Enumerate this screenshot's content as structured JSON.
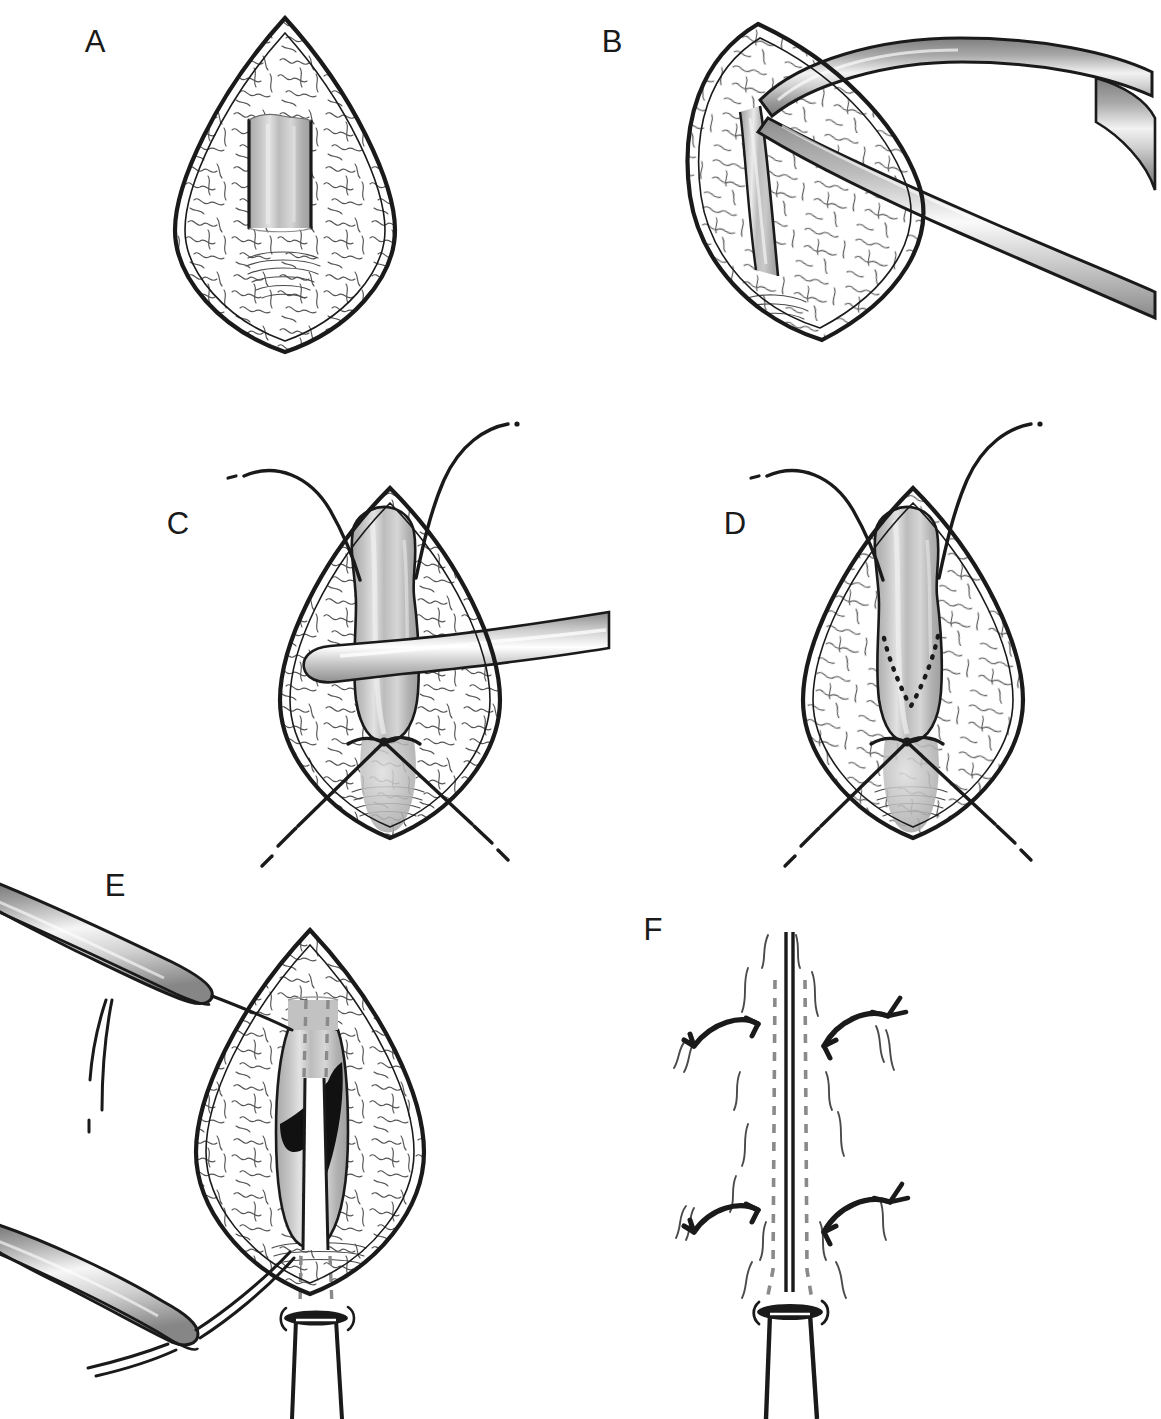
{
  "figure": {
    "type": "medical-surgical-illustration",
    "title": "",
    "caption": "",
    "background_color": "#ffffff",
    "width": 1161,
    "height": 1419,
    "layout": "3 rows x 2 columns of labeled panels",
    "ink_color": "#1a1a1a",
    "tissue_grey": "#b5b5b5",
    "tissue_grey_light": "#d2d2d2",
    "tissue_grey_dark": "#9a9a9a",
    "metal_grey": "#9e9e9e",
    "dashed_grey": "#8c8c8c"
  },
  "panels": [
    {
      "id": "A",
      "label": "A",
      "label_x": 95,
      "label_y": 52,
      "description": "Lens-shaped surgical exposure with wavy textured tissue and a central grey rectangular structure",
      "elements": [
        "lens-shaped-opening",
        "wavy-tissue-texture",
        "central-grey-rectangle"
      ]
    },
    {
      "id": "B",
      "label": "B",
      "label_x": 612,
      "label_y": 52,
      "description": "Lens-shaped exposure with curved surgical forceps grasping the grey tubular structure",
      "elements": [
        "lens-shaped-opening-tilted",
        "curved-forceps",
        "grey-band-structure"
      ]
    },
    {
      "id": "C",
      "label": "C",
      "label_x": 178,
      "label_y": 534,
      "description": "Mobilized grey tubular structure with two stay sutures at top, a probe passing beneath, and crossed sutures at the base",
      "elements": [
        "lens-shaped-opening",
        "grey-tubular-structure",
        "upper-stay-sutures",
        "horizontal-probe",
        "crossed-lower-sutures"
      ]
    },
    {
      "id": "D",
      "label": "D",
      "label_x": 735,
      "label_y": 534,
      "description": "Same exposure with a dotted V-shaped planned incision marked on the grey structure",
      "elements": [
        "lens-shaped-opening",
        "grey-tubular-structure",
        "upper-stay-sutures",
        "dotted-v-incision-marking",
        "crossed-lower-sutures"
      ]
    },
    {
      "id": "E",
      "label": "E",
      "label_x": 115,
      "label_y": 896,
      "description": "Two forceps retract sutures while the opened structure (black flaps) is fitted over a white tube passing through the wound",
      "elements": [
        "lens-shaped-opening",
        "upper-forceps",
        "lower-forceps",
        "black-cut-flaps",
        "white-tube",
        "dashed-tube-path",
        "tube-flange"
      ]
    },
    {
      "id": "F",
      "label": "F",
      "label_x": 653,
      "label_y": 940,
      "description": "Closed midline repair with dashed tube outline and four curved approximation arrows",
      "elements": [
        "midline-closure-line",
        "dashed-tube-outline",
        "curved-arrow-left-upper",
        "curved-arrow-right-upper",
        "curved-arrow-left-lower",
        "curved-arrow-right-lower",
        "tube-flange",
        "exiting-tube"
      ]
    }
  ]
}
